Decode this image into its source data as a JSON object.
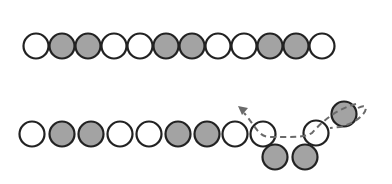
{
  "diagram": {
    "title": "",
    "colors": {
      "white_bead_fill": "#ffffff",
      "gray_bead_fill": "#a3a3a3",
      "bead_stroke": "#222222",
      "dashed_path": "#6a6a6a"
    },
    "radius": 12.5,
    "rows": [
      {
        "name": "top-row",
        "beads": [
          {
            "x": 36,
            "y": 46,
            "color": "white"
          },
          {
            "x": 62,
            "y": 46,
            "color": "gray"
          },
          {
            "x": 88,
            "y": 46,
            "color": "gray"
          },
          {
            "x": 114,
            "y": 46,
            "color": "white"
          },
          {
            "x": 140,
            "y": 46,
            "color": "white"
          },
          {
            "x": 166,
            "y": 46,
            "color": "gray"
          },
          {
            "x": 192,
            "y": 46,
            "color": "gray"
          },
          {
            "x": 218,
            "y": 46,
            "color": "white"
          },
          {
            "x": 244,
            "y": 46,
            "color": "white"
          },
          {
            "x": 270,
            "y": 46,
            "color": "gray"
          },
          {
            "x": 296,
            "y": 46,
            "color": "gray"
          },
          {
            "x": 322,
            "y": 46,
            "color": "white"
          }
        ]
      },
      {
        "name": "bottom-row",
        "beads": [
          {
            "x": 32,
            "y": 134,
            "color": "white"
          },
          {
            "x": 62,
            "y": 134,
            "color": "gray"
          },
          {
            "x": 91,
            "y": 134,
            "color": "gray"
          },
          {
            "x": 120,
            "y": 134,
            "color": "white"
          },
          {
            "x": 149,
            "y": 134,
            "color": "white"
          },
          {
            "x": 178,
            "y": 134,
            "color": "gray"
          },
          {
            "x": 207,
            "y": 134,
            "color": "gray"
          },
          {
            "x": 235,
            "y": 134,
            "color": "white"
          },
          {
            "x": 263,
            "y": 134,
            "color": "white"
          },
          {
            "x": 275,
            "y": 157,
            "color": "gray"
          },
          {
            "x": 305,
            "y": 157,
            "color": "gray"
          },
          {
            "x": 316,
            "y": 133,
            "color": "white"
          },
          {
            "x": 344,
            "y": 114,
            "color": "gray"
          }
        ]
      }
    ],
    "path": {
      "style": "dashed",
      "d": "M 358 108 C 372 100, 368 120, 340 127 L 330 128 M 356 104 C 340 108, 325 118, 312 133 C 305 137, 300 137, 270 137 C 258 137, 255 125, 244 113",
      "arrow_tip": {
        "x": 238,
        "y": 106
      },
      "direction": "leftward-up"
    }
  }
}
